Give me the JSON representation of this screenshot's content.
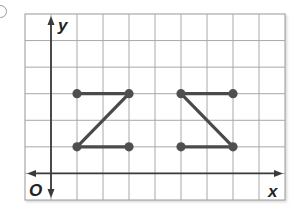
{
  "figure": {
    "item_marker": "circle",
    "axis_labels": {
      "x": "x",
      "y": "y",
      "origin": "O"
    },
    "grid": {
      "columns": 10,
      "rows": 7,
      "x_min": -1,
      "x_max": 9,
      "y_min": -1,
      "y_max": 6
    },
    "colors": {
      "grid": "#a8a8a8",
      "axis": "#3a3a3a",
      "segment": "#4a4a4a",
      "point": "#4f4f4f",
      "border": "#9a9a9a"
    }
  },
  "chart_data": {
    "type": "scatter",
    "title": "",
    "xlabel": "x",
    "ylabel": "y",
    "xlim": [
      -1,
      9
    ],
    "ylim": [
      -1,
      6
    ],
    "grid": true,
    "series": [
      {
        "name": "Original figure (Z)",
        "points": [
          [
            1,
            3
          ],
          [
            3,
            3
          ],
          [
            1,
            1
          ],
          [
            3,
            1
          ]
        ],
        "segments": [
          [
            [
              1,
              3
            ],
            [
              3,
              3
            ]
          ],
          [
            [
              3,
              3
            ],
            [
              1,
              1
            ]
          ],
          [
            [
              1,
              1
            ],
            [
              3,
              1
            ]
          ]
        ]
      },
      {
        "name": "Transformed figure (reflected Z)",
        "points": [
          [
            5,
            3
          ],
          [
            7,
            3
          ],
          [
            5,
            1
          ],
          [
            7,
            1
          ]
        ],
        "segments": [
          [
            [
              5,
              3
            ],
            [
              7,
              3
            ]
          ],
          [
            [
              5,
              3
            ],
            [
              7,
              1
            ]
          ],
          [
            [
              5,
              1
            ],
            [
              7,
              1
            ]
          ]
        ]
      }
    ]
  }
}
